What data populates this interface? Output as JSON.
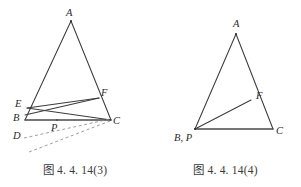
{
  "page": {
    "background_color": "#ffffff",
    "ink_color": "#3c3c3c",
    "dashed_color": "#8e8e8e"
  },
  "figures": [
    {
      "id": "figure-3",
      "caption": "图 4. 4. 14(3)",
      "description": "Triangle ABC with point F on side AC, point E outside near B, segments EF, EC, BF intersecting at P, and two dashed construction rays through D toward C",
      "vertex_labels": [
        {
          "name": "A",
          "text": "A",
          "x": 66,
          "y": 8
        },
        {
          "name": "E",
          "text": "E",
          "x": 15,
          "y": 99
        },
        {
          "name": "F",
          "text": "F",
          "x": 101,
          "y": 88
        },
        {
          "name": "B",
          "text": "B",
          "x": 13,
          "y": 113
        },
        {
          "name": "C",
          "text": "C",
          "x": 113,
          "y": 116
        },
        {
          "name": "P",
          "text": "P",
          "x": 51,
          "y": 127
        },
        {
          "name": "D",
          "text": "D",
          "x": 13,
          "y": 131
        }
      ],
      "points": {
        "A": [
          71,
          21
        ],
        "B": [
          25,
          120
        ],
        "C": [
          111,
          120
        ],
        "E": [
          27,
          108
        ],
        "F": [
          99,
          98
        ],
        "P": [
          57,
          120
        ],
        "D": [
          24,
          140
        ]
      },
      "segments": [
        {
          "name": "AB",
          "from": "A",
          "to": "B",
          "style": "solid"
        },
        {
          "name": "AC",
          "from": "A",
          "to": "C",
          "style": "solid"
        },
        {
          "name": "BC",
          "from": "B",
          "to": "C",
          "style": "base"
        },
        {
          "name": "EF",
          "from": "E",
          "to": "F",
          "style": "solid"
        },
        {
          "name": "EC",
          "from": "E",
          "to": "C",
          "style": "solid"
        },
        {
          "name": "BF",
          "from": "B",
          "to": "F",
          "style": "solid"
        }
      ],
      "dashed_rays": [
        {
          "name": "dashed-upper",
          "x1": 24,
          "y1": 138,
          "x2": 110,
          "y2": 119
        },
        {
          "name": "dashed-lower",
          "x1": 29,
          "y1": 152,
          "x2": 110,
          "y2": 121
        }
      ]
    },
    {
      "id": "figure-4",
      "caption": "图 4. 4. 14(4)",
      "description": "Triangle ABC with point F on side AC and cevian from B (coincident with P) to F",
      "vertex_labels": [
        {
          "name": "A",
          "text": "A",
          "x": 83,
          "y": 19
        },
        {
          "name": "F",
          "text": "F",
          "x": 106,
          "y": 91
        },
        {
          "name": "B,P",
          "text": "B, P",
          "x": 24,
          "y": 133
        },
        {
          "name": "C",
          "text": "C",
          "x": 126,
          "y": 126
        }
      ],
      "points": {
        "A": [
          86,
          34
        ],
        "B": [
          45,
          129
        ],
        "C": [
          123,
          129
        ],
        "F": [
          101,
          100
        ]
      },
      "segments": [
        {
          "name": "AB",
          "from": "A",
          "to": "B",
          "style": "solid"
        },
        {
          "name": "AC",
          "from": "A",
          "to": "C",
          "style": "solid"
        },
        {
          "name": "BC",
          "from": "B",
          "to": "C",
          "style": "base"
        },
        {
          "name": "BF",
          "from": "B",
          "to": "F",
          "style": "solid"
        }
      ],
      "dashed_rays": []
    }
  ]
}
